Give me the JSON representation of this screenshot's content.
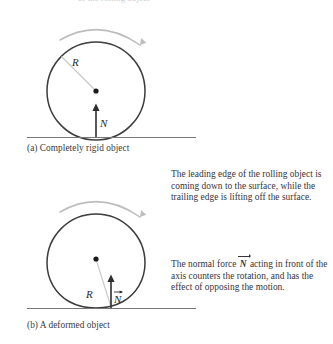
{
  "figure": {
    "top_clipped_text": "of the rolling object",
    "panels": [
      {
        "id": "a",
        "caption": "(a) Completely rigid object",
        "radius_label": "R",
        "normal_label": "N",
        "normal_is_vector": false,
        "rotation": "clockwise"
      },
      {
        "id": "b",
        "caption": "(b) A deformed object",
        "radius_label": "R",
        "normal_label": "N",
        "normal_is_vector": true,
        "rotation": "clockwise"
      }
    ],
    "notes": [
      {
        "id": "leading-edge-note",
        "text": "The leading edge of the rolling object is coming down to the surface, while the trailing edge is lifting off the surface."
      },
      {
        "id": "normal-force-note",
        "text_before": "The normal force ",
        "vector_symbol": "N",
        "text_after": " acting in front of the axis counters the rotation, and has the effect of opposing the motion."
      }
    ]
  },
  "colors": {
    "outline": "#3c3c3c",
    "ground": "#6f6f6f",
    "radius_line": "#c2c2c2",
    "arc_arrow": "#b8b8b8",
    "text": "#36343a",
    "background": "#ffffff"
  }
}
